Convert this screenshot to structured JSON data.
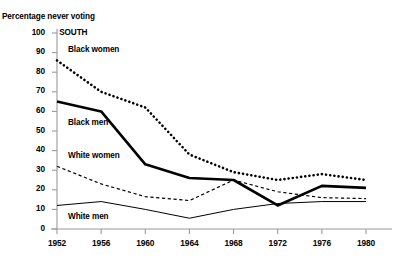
{
  "chart_data": {
    "type": "line",
    "title": "",
    "panel_label": "SOUTH",
    "ylabel": "Percentage never voting",
    "xlabel": "",
    "categories": [
      "1952",
      "1956",
      "1960",
      "1964",
      "1968",
      "1972",
      "1976",
      "1980"
    ],
    "x": [
      1952,
      1956,
      1960,
      1964,
      1968,
      1972,
      1976,
      1980
    ],
    "ylim": [
      0,
      100
    ],
    "yticks": [
      "0",
      "10",
      "20",
      "30",
      "40",
      "50",
      "60",
      "70",
      "80",
      "90",
      "100"
    ],
    "grid": false,
    "legend": "inline-labels",
    "series": [
      {
        "name": "Black women",
        "style": "thick-dotted",
        "color": "#000000",
        "values": [
          86,
          70,
          62,
          38,
          29,
          25,
          28,
          25
        ]
      },
      {
        "name": "Black men",
        "style": "thick-solid",
        "color": "#000000",
        "values": [
          65,
          60,
          33,
          26,
          25,
          12,
          22,
          21
        ]
      },
      {
        "name": "White women",
        "style": "thin-dashed",
        "color": "#000000",
        "values": [
          32,
          23,
          16.5,
          14.5,
          25,
          19,
          16,
          15.5
        ]
      },
      {
        "name": "White men",
        "style": "thin-solid",
        "color": "#000000",
        "values": [
          12,
          14,
          10,
          5.5,
          10,
          13,
          14,
          14
        ]
      }
    ],
    "annotations": [
      {
        "text": "Black women",
        "x": 1953.0,
        "y": 91
      },
      {
        "text": "Black men",
        "x": 1953.0,
        "y": 54
      },
      {
        "text": "White women",
        "x": 1953.0,
        "y": 37
      },
      {
        "text": "White men",
        "x": 1953.0,
        "y": 6
      }
    ]
  }
}
